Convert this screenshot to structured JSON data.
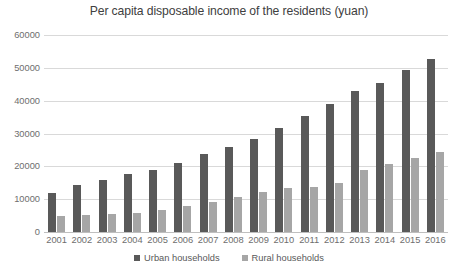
{
  "chart_data": {
    "type": "bar",
    "title": "Per capita disposable income of the residents (yuan)",
    "xlabel": "",
    "ylabel": "",
    "ylim": [
      0,
      60000
    ],
    "ytick_values": [
      60000,
      50000,
      40000,
      30000,
      20000,
      10000,
      0
    ],
    "ytick_labels": [
      "60000",
      "50000",
      "40000",
      "30000",
      "20000",
      "10000",
      "0"
    ],
    "grid": true,
    "legend_position": "bottom",
    "categories": [
      "2001",
      "2002",
      "2003",
      "2004",
      "2005",
      "2006",
      "2007",
      "2008",
      "2009",
      "2010",
      "2011",
      "2012",
      "2013",
      "2014",
      "2015",
      "2016"
    ],
    "series": [
      {
        "name": "Urban households",
        "color": "#595959",
        "values": [
          12000,
          14200,
          15800,
          17800,
          18900,
          21000,
          23900,
          26000,
          28300,
          31600,
          35400,
          38900,
          42800,
          45500,
          49400,
          52700
        ]
      },
      {
        "name": "Rural households",
        "color": "#a6a6a6",
        "values": [
          4800,
          5200,
          5400,
          5800,
          6700,
          7800,
          9200,
          10600,
          12100,
          13400,
          13800,
          14900,
          18800,
          20700,
          22400,
          24400
        ]
      }
    ]
  }
}
